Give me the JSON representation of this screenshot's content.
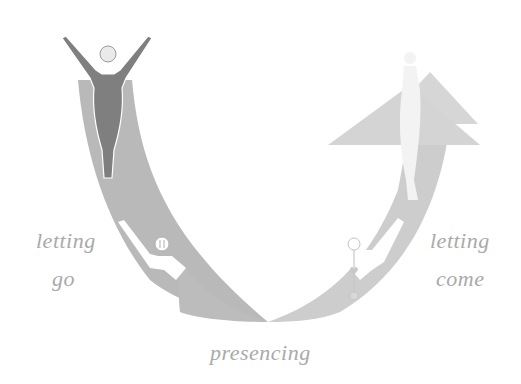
{
  "diagram": {
    "type": "U-process",
    "labels": {
      "left_line1": "letting",
      "left_line2": "go",
      "right_line1": "letting",
      "right_line2": "come",
      "bottom": "presencing"
    },
    "colors": {
      "left_band": "#b9b9b9",
      "right_band": "#cfcfcf",
      "arrow_head": "#d6d6d6",
      "dark_figure": "#7f7f7f",
      "light_figure": "#ffffff",
      "text": "#a9a9a9"
    },
    "figures": [
      {
        "name": "standing-figure-arms-raised",
        "position": "top-left",
        "tone": "dark"
      },
      {
        "name": "reaching-figure-left",
        "position": "bottom-left",
        "tone": "white"
      },
      {
        "name": "reaching-figure-right-with-chakras",
        "position": "bottom-right",
        "tone": "white"
      },
      {
        "name": "ghost-figure-in-arrow",
        "position": "top-right",
        "tone": "white"
      }
    ]
  }
}
